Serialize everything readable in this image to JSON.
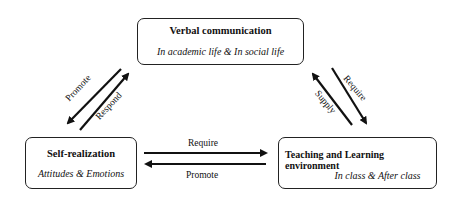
{
  "nodes": {
    "verbal": {
      "title": "Verbal communication",
      "subtitle": "In academic life & In social life"
    },
    "self": {
      "title": "Self-realization",
      "subtitle": "Attitudes & Emotions"
    },
    "teaching": {
      "title": "Teaching and Learning environment",
      "subtitle": "In class & After class"
    }
  },
  "edges": {
    "verbal_to_self": "Promote",
    "self_to_verbal": "Respond",
    "teaching_to_verbal": "Supply",
    "verbal_to_teaching": "Require",
    "self_to_teaching": "Require",
    "teaching_to_self": "Promote"
  }
}
